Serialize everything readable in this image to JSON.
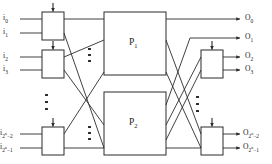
{
  "figure": {
    "type": "three-stage-switching-network-diagram",
    "title": ""
  },
  "inputs": {
    "labels": [
      {
        "id": "i0",
        "base": "i",
        "sub": "0",
        "text": "i",
        "subtext": "0"
      },
      {
        "id": "i1",
        "base": "i",
        "sub": "1",
        "text": "i",
        "subtext": "1"
      },
      {
        "id": "i2",
        "base": "i",
        "sub": "2",
        "text": "i",
        "subtext": "2"
      },
      {
        "id": "i3",
        "base": "i",
        "sub": "3",
        "text": "i",
        "subtext": "3"
      },
      {
        "id": "i2n-2",
        "base": "i",
        "sub": "2",
        "sup": "n",
        "tail": "−2",
        "text": "i",
        "subtext": "2"
      },
      {
        "id": "i2n-1",
        "base": "i",
        "sub": "2",
        "sup": "n",
        "tail": "−1",
        "text": "i",
        "subtext": "2"
      }
    ]
  },
  "outputs": {
    "labels": [
      {
        "id": "O0",
        "base": "O",
        "sub": "0"
      },
      {
        "id": "O1",
        "base": "O",
        "sub": "1"
      },
      {
        "id": "O2",
        "base": "O",
        "sub": "2"
      },
      {
        "id": "O3",
        "base": "O",
        "sub": "3"
      },
      {
        "id": "O2n-2",
        "base": "O",
        "sub": "2",
        "sup": "n",
        "tail": "−2"
      },
      {
        "id": "O2n-1",
        "base": "O",
        "sub": "2",
        "sup": "n",
        "tail": "−1"
      }
    ]
  },
  "blocks": {
    "p1": {
      "base": "P",
      "sub": "1"
    },
    "p2": {
      "base": "P",
      "sub": "2"
    }
  },
  "switches": {
    "input": [
      {
        "name": "input-switch-top"
      },
      {
        "name": "input-switch-second"
      },
      {
        "name": "input-switch-bottom"
      }
    ],
    "output": [
      {
        "name": "output-switch-upper"
      },
      {
        "name": "output-switch-lower"
      }
    ]
  },
  "ellipses": {
    "left_inputs": "vertical-ellipsis",
    "center_upper": "vertical-ellipsis",
    "center_lower": "vertical-ellipsis",
    "right_outputs": "vertical-ellipsis"
  },
  "colors": {
    "line": "#2b2b2b",
    "background": "#ffffff",
    "text": "#1a1a1a"
  }
}
